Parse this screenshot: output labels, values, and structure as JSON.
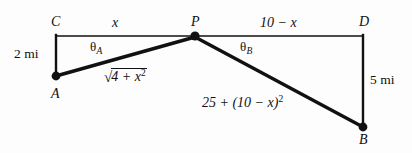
{
  "figure": {
    "background_color": "#fdfdfd",
    "stroke_color": "#111111"
  },
  "vertices": [
    {
      "id": "C",
      "label": "C",
      "x": 56,
      "y": 36,
      "dot": false
    },
    {
      "id": "P",
      "label": "P",
      "x": 195,
      "y": 36,
      "dot": true
    },
    {
      "id": "D",
      "label": "D",
      "x": 363,
      "y": 36,
      "dot": false
    },
    {
      "id": "A",
      "label": "A",
      "x": 56,
      "y": 76,
      "dot": true
    },
    {
      "id": "B",
      "label": "B",
      "x": 363,
      "y": 127,
      "dot": true
    }
  ],
  "segments": [
    {
      "id": "CP",
      "from": "C",
      "to": "P",
      "width": 1.4,
      "label": "x"
    },
    {
      "id": "PD",
      "from": "P",
      "to": "D",
      "width": 1.4,
      "label": "10 − x"
    },
    {
      "id": "CA",
      "from": "C",
      "to": "A",
      "width": 2.4,
      "label": "2 mi"
    },
    {
      "id": "DB",
      "from": "D",
      "to": "B",
      "width": 2.4,
      "label": "5 mi"
    },
    {
      "id": "AP",
      "from": "A",
      "to": "P",
      "width": 3.4,
      "label": "√(4 + x²)"
    },
    {
      "id": "PB",
      "from": "P",
      "to": "B",
      "width": 3.4,
      "label": "25 + (10 − x)²"
    }
  ],
  "labels": {
    "top_left_segment": "x",
    "top_right_segment": "10 − x",
    "left_side": "2 mi",
    "right_side": "5 mi",
    "angle_a": "θ",
    "angle_a_sub": "A",
    "angle_b": "θ",
    "angle_b_sub": "B",
    "ap_prefix": "4 + x",
    "ap_exp": "2",
    "pb_text": "25 + (10 − x)",
    "pb_exp": "2",
    "minus": "−",
    "radical_sign": "√"
  }
}
